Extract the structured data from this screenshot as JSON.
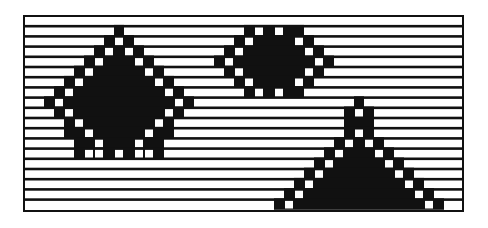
{
  "figure": {
    "frame": {
      "x": 24,
      "y": 16,
      "width": 439,
      "height": 195
    },
    "colors": {
      "ink": "#111111",
      "paper": "#ffffff"
    },
    "rows": 19,
    "row_height": 10.2,
    "cell_width": 10,
    "bar_thickness": 2.6,
    "shapes": [
      {
        "name": "left-diamond",
        "rows": [
          {
            "r": 1,
            "black": [
              [
                9,
                9
              ]
            ],
            "white": []
          },
          {
            "r": 2,
            "black": [
              [
                8,
                10
              ]
            ],
            "white": [
              9
            ]
          },
          {
            "r": 3,
            "black": [
              [
                7,
                11
              ]
            ],
            "white": [
              8,
              10
            ]
          },
          {
            "r": 4,
            "black": [
              [
                6,
                12
              ]
            ],
            "white": [
              7,
              11
            ]
          },
          {
            "r": 5,
            "black": [
              [
                5,
                13
              ]
            ],
            "white": [
              6,
              12
            ]
          },
          {
            "r": 6,
            "black": [
              [
                4,
                14
              ]
            ],
            "white": [
              5,
              13
            ]
          },
          {
            "r": 7,
            "black": [
              [
                3,
                15
              ]
            ],
            "white": [
              4,
              14
            ]
          },
          {
            "r": 8,
            "black": [
              [
                2,
                16
              ]
            ],
            "white": [
              3,
              15
            ]
          },
          {
            "r": 9,
            "black": [
              [
                3,
                15
              ]
            ],
            "white": [
              4,
              14
            ]
          },
          {
            "r": 10,
            "black": [
              [
                4,
                14
              ]
            ],
            "white": [
              5,
              13
            ]
          },
          {
            "r": 11,
            "black": [
              [
                4,
                14
              ]
            ],
            "white": [
              6,
              12
            ]
          },
          {
            "r": 12,
            "black": [
              [
                5,
                13
              ]
            ],
            "white": [
              7,
              11
            ]
          },
          {
            "r": 13,
            "black": [
              [
                5,
                13
              ]
            ],
            "white": [
              6,
              7,
              9,
              11,
              12
            ]
          }
        ]
      },
      {
        "name": "top-right-diamond",
        "rows": [
          {
            "r": 1,
            "black": [
              [
                22,
                27
              ]
            ],
            "white": [
              23,
              25
            ]
          },
          {
            "r": 2,
            "black": [
              [
                21,
                28
              ]
            ],
            "white": [
              22,
              27
            ]
          },
          {
            "r": 3,
            "black": [
              [
                20,
                29
              ]
            ],
            "white": [
              21,
              28
            ]
          },
          {
            "r": 4,
            "black": [
              [
                19,
                30
              ]
            ],
            "white": [
              20,
              29
            ]
          },
          {
            "r": 5,
            "black": [
              [
                20,
                29
              ]
            ],
            "white": [
              21,
              28
            ]
          },
          {
            "r": 6,
            "black": [
              [
                21,
                28
              ]
            ],
            "white": [
              22,
              27
            ]
          },
          {
            "r": 7,
            "black": [
              [
                22,
                27
              ]
            ],
            "white": [
              23,
              25
            ]
          }
        ]
      },
      {
        "name": "bottom-right-triangle",
        "rows": [
          {
            "r": 8,
            "black": [
              [
                33,
                33
              ]
            ],
            "white": []
          },
          {
            "r": 9,
            "black": [
              [
                32,
                34
              ]
            ],
            "white": [
              33
            ]
          },
          {
            "r": 10,
            "black": [
              [
                32,
                34
              ]
            ],
            "white": []
          },
          {
            "r": 11,
            "black": [
              [
                32,
                34
              ]
            ],
            "white": [
              33
            ]
          },
          {
            "r": 12,
            "black": [
              [
                31,
                35
              ]
            ],
            "white": [
              32,
              34
            ]
          },
          {
            "r": 13,
            "black": [
              [
                30,
                36
              ]
            ],
            "white": [
              31,
              35
            ]
          },
          {
            "r": 14,
            "black": [
              [
                29,
                37
              ]
            ],
            "white": [
              30,
              36
            ]
          },
          {
            "r": 15,
            "black": [
              [
                28,
                38
              ]
            ],
            "white": [
              29,
              37
            ]
          },
          {
            "r": 16,
            "black": [
              [
                27,
                39
              ]
            ],
            "white": [
              28,
              38
            ]
          },
          {
            "r": 17,
            "black": [
              [
                26,
                40
              ]
            ],
            "white": [
              27,
              39
            ]
          },
          {
            "r": 18,
            "black": [
              [
                25,
                41
              ]
            ],
            "white": [
              26,
              40
            ]
          }
        ]
      }
    ]
  }
}
